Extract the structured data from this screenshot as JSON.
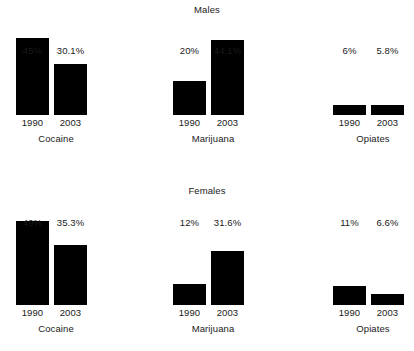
{
  "chart_data": {
    "type": "bar",
    "title": "",
    "xlabel": "",
    "ylabel": "",
    "categories": [
      "1990",
      "2003"
    ],
    "grid": false,
    "legend": "none",
    "ylim": [
      0,
      49
    ],
    "panels": [
      {
        "title": "Males",
        "groups": [
          {
            "name": "Cocaine",
            "bars": [
              {
                "category": "1990",
                "value": 45,
                "label": "45%"
              },
              {
                "category": "2003",
                "value": 30.1,
                "label": "30.1%"
              }
            ]
          },
          {
            "name": "Marijuana",
            "bars": [
              {
                "category": "1990",
                "value": 20,
                "label": "20%"
              },
              {
                "category": "2003",
                "value": 44.1,
                "label": "44.1%"
              }
            ]
          },
          {
            "name": "Opiates",
            "bars": [
              {
                "category": "1990",
                "value": 6,
                "label": "6%"
              },
              {
                "category": "2003",
                "value": 5.8,
                "label": "5.8%"
              }
            ]
          }
        ]
      },
      {
        "title": "Females",
        "groups": [
          {
            "name": "Cocaine",
            "bars": [
              {
                "category": "1990",
                "value": 49,
                "label": "49%"
              },
              {
                "category": "2003",
                "value": 35.3,
                "label": "35.3%"
              }
            ]
          },
          {
            "name": "Marijuana",
            "bars": [
              {
                "category": "1990",
                "value": 12,
                "label": "12%"
              },
              {
                "category": "2003",
                "value": 31.6,
                "label": "31.6%"
              }
            ]
          },
          {
            "name": "Opiates",
            "bars": [
              {
                "category": "1990",
                "value": 11,
                "label": "11%"
              },
              {
                "category": "2003",
                "value": 6.6,
                "label": "6.6%"
              }
            ]
          }
        ]
      }
    ],
    "colors": {
      "bar": "#000000",
      "text": "#1a1a1a",
      "background": "#ffffff"
    },
    "scale": {
      "males_max_value": 45,
      "males_max_px": 77,
      "females_max_value": 49,
      "females_max_px": 83
    }
  }
}
